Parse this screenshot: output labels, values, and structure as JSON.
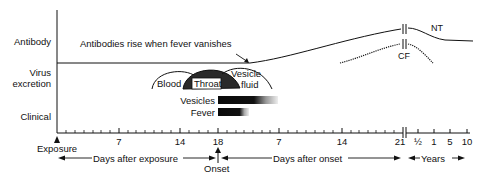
{
  "rows": {
    "antibody": "Antibody",
    "virus_line1": "Virus",
    "virus_line2": "excretion",
    "clinical": "Clinical"
  },
  "annotations": {
    "antibody_rise": "Antibodies rise when fever vanishes",
    "nt": "NT",
    "cf": "CF",
    "blood": "Blood",
    "throat": "Throat",
    "vesicle_line1": "Vesicle",
    "vesicle_line2": "fluid",
    "vesicles": "Vesicles",
    "fever": "Fever"
  },
  "axis": {
    "ticks": [
      {
        "label": "7",
        "x": 119
      },
      {
        "label": "14",
        "x": 180
      },
      {
        "label": "18",
        "x": 218
      },
      {
        "label": "7",
        "x": 279
      },
      {
        "label": "14",
        "x": 342
      },
      {
        "label": "21",
        "x": 402
      },
      {
        "label": "½",
        "x": 418
      },
      {
        "label": "1",
        "x": 434
      },
      {
        "label": "5",
        "x": 450
      },
      {
        "label": "10",
        "x": 467
      }
    ],
    "exposure": "Exposure",
    "onset": "Onset",
    "days_after_exposure": "Days after exposure",
    "days_after_onset": "Days after onset",
    "years": "Years"
  },
  "colors": {
    "ink": "#111111",
    "throat_fill": "#333333",
    "bar_fill": "#0a0a0a"
  }
}
